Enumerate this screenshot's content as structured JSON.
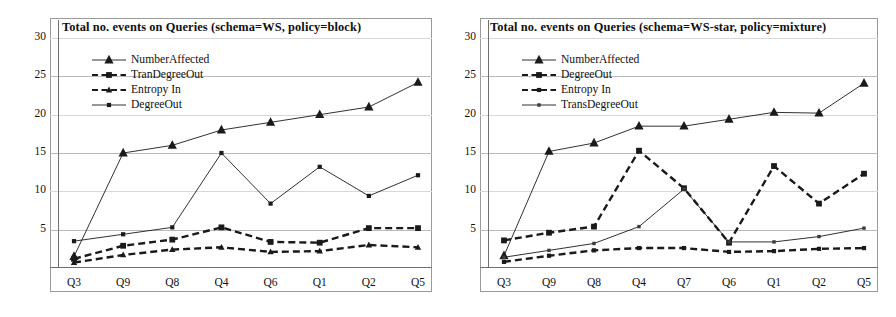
{
  "figure": {
    "background": "#ffffff",
    "axis_color": "#6f6f6f",
    "grid_color": "#b9b9b9",
    "series_color": "#1a1a1a"
  },
  "chart_data": [
    {
      "type": "line",
      "panel": "left",
      "title": "Total no. events on Queries (schema=WS, policy=block)",
      "xlabel": "",
      "ylabel": "",
      "categories": [
        "Q3",
        "Q9",
        "Q8",
        "Q4",
        "Q6",
        "Q1",
        "Q2",
        "Q5"
      ],
      "yticks": [
        5,
        10,
        15,
        20,
        25,
        30
      ],
      "ylim": [
        0,
        30
      ],
      "grid": true,
      "legend_position": "upper-left",
      "series": [
        {
          "name": "NumberAffected",
          "marker": "triangle",
          "line": "solid",
          "values": [
            1.5,
            15.0,
            16.0,
            18.0,
            19.0,
            20.0,
            21.0,
            24.2
          ]
        },
        {
          "name": "TranDegreeOut",
          "marker": "square",
          "line": "dashed",
          "values": [
            1.2,
            2.9,
            3.7,
            5.3,
            3.4,
            3.3,
            5.2,
            5.2
          ]
        },
        {
          "name": "Entropy In",
          "marker": "triangle-small",
          "line": "dashed",
          "values": [
            0.7,
            1.7,
            2.4,
            2.7,
            2.1,
            2.2,
            3.0,
            2.7
          ]
        },
        {
          "name": "DegreeOut",
          "marker": "square-small",
          "line": "solid",
          "values": [
            3.5,
            4.4,
            5.3,
            15.0,
            8.4,
            13.2,
            9.4,
            12.1
          ]
        }
      ]
    },
    {
      "type": "line",
      "panel": "right",
      "title": "Total no. events on Queries (schema=WS-star, policy=mixture)",
      "xlabel": "",
      "ylabel": "",
      "categories": [
        "Q3",
        "Q9",
        "Q8",
        "Q4",
        "Q7",
        "Q6",
        "Q1",
        "Q2",
        "Q5"
      ],
      "yticks": [
        5,
        10,
        15,
        20,
        25,
        30
      ],
      "ylim": [
        0,
        30
      ],
      "grid": true,
      "legend_position": "upper-left",
      "series": [
        {
          "name": "NumberAffected",
          "marker": "triangle",
          "line": "solid",
          "values": [
            1.6,
            15.2,
            16.3,
            18.5,
            18.5,
            19.4,
            20.3,
            20.2,
            24.1
          ]
        },
        {
          "name": "DegreeOut",
          "marker": "square",
          "line": "dashed",
          "values": [
            3.6,
            4.6,
            5.4,
            15.3,
            10.4,
            3.3,
            13.3,
            8.4,
            12.3
          ]
        },
        {
          "name": "Entropy In",
          "marker": "square-small",
          "line": "dashed",
          "values": [
            0.8,
            1.6,
            2.3,
            2.6,
            2.6,
            2.1,
            2.2,
            2.5,
            2.6
          ]
        },
        {
          "name": "TransDegreeOut",
          "marker": "dot",
          "line": "solid",
          "values": [
            1.4,
            2.3,
            3.2,
            5.4,
            10.3,
            3.4,
            3.4,
            4.1,
            5.2
          ]
        }
      ]
    }
  ]
}
